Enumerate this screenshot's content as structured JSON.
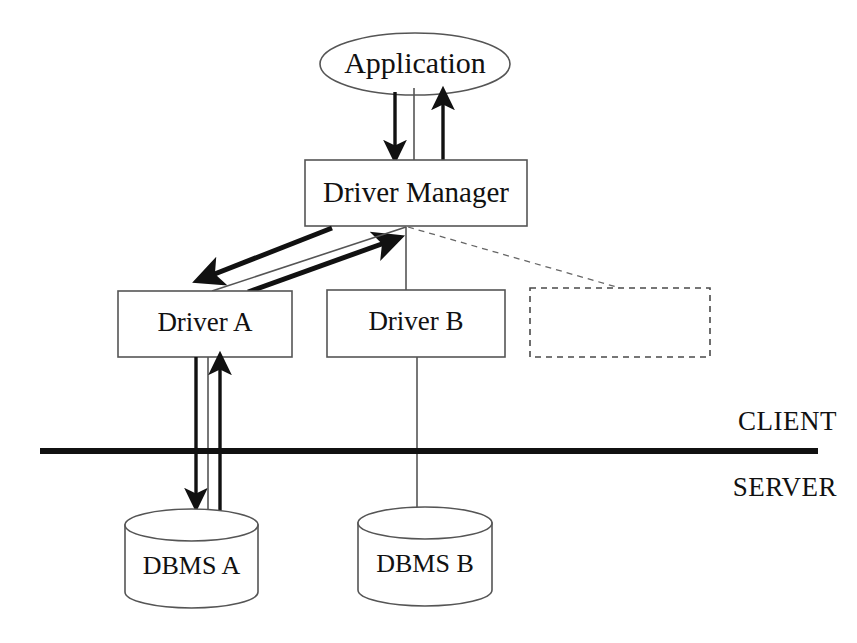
{
  "diagram": {
    "nodes": {
      "application": {
        "label": "Application",
        "shape": "ellipse"
      },
      "driver_manager": {
        "label": "Driver Manager",
        "shape": "rectangle"
      },
      "driver_a": {
        "label": "Driver A",
        "shape": "rectangle"
      },
      "driver_b": {
        "label": "Driver B",
        "shape": "rectangle"
      },
      "driver_placeholder": {
        "label": "",
        "shape": "rectangle-dashed"
      },
      "dbms_a": {
        "label": "DBMS A",
        "shape": "cylinder"
      },
      "dbms_b": {
        "label": "DBMS B",
        "shape": "cylinder"
      }
    },
    "tiers": {
      "client": "CLIENT",
      "server": "SERVER"
    },
    "colors": {
      "stroke": "#555555",
      "bold_stroke": "#111111",
      "text": "#111111",
      "background": "#ffffff"
    }
  }
}
